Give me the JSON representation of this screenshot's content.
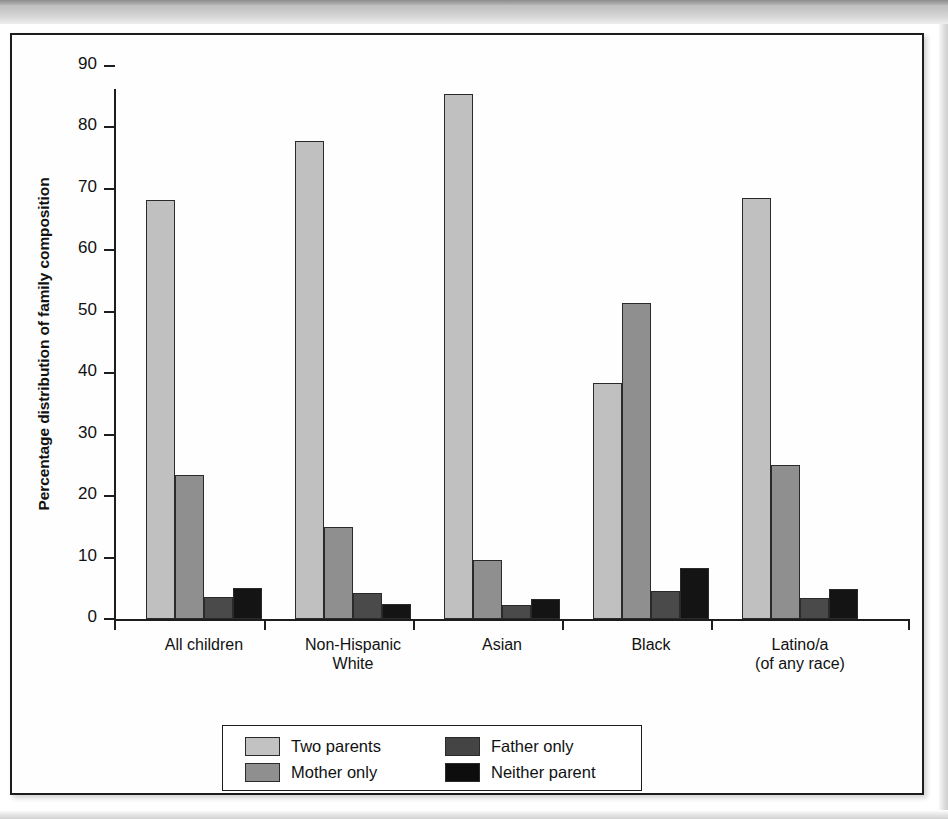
{
  "chart_data": {
    "type": "bar",
    "title": "",
    "xlabel": "",
    "ylabel": "Percentage distribution of family composition",
    "ylim": [
      0,
      90
    ],
    "yticks": [
      0,
      10,
      20,
      30,
      40,
      50,
      60,
      70,
      80,
      90
    ],
    "grid": false,
    "legend_position": "bottom-center",
    "categories": [
      "All children",
      "Non-Hispanic\nWhite",
      "Asian",
      "Black",
      "Latino/a\n(of any race)"
    ],
    "category_lines": [
      [
        "All children"
      ],
      [
        "Non-Hispanic",
        "White"
      ],
      [
        "Asian"
      ],
      [
        "Black"
      ],
      [
        "Latino/a",
        "(of any race)"
      ]
    ],
    "series": [
      {
        "name": "Two parents",
        "color": "#c0c0c0",
        "values": [
          68.2,
          77.8,
          85.5,
          38.4,
          68.6
        ]
      },
      {
        "name": "Mother only",
        "color": "#8f8f8f",
        "values": [
          23.5,
          15.0,
          9.6,
          51.5,
          25.1
        ]
      },
      {
        "name": "Father only",
        "color": "#4a4a4a",
        "values": [
          3.6,
          4.2,
          2.2,
          4.6,
          3.4
        ]
      },
      {
        "name": "Neither parent",
        "color": "#141414",
        "values": [
          5.1,
          2.5,
          3.3,
          8.3,
          4.9
        ]
      }
    ]
  },
  "legend": {
    "entries": [
      {
        "label": "Two parents"
      },
      {
        "label": "Father only"
      },
      {
        "label": "Mother only"
      },
      {
        "label": "Neither parent"
      }
    ]
  },
  "axes": {
    "y_title": "Percentage distribution of family composition",
    "y_tick_labels": [
      "90",
      "80",
      "70",
      "60",
      "50",
      "40",
      "30",
      "20",
      "10",
      "0"
    ]
  }
}
